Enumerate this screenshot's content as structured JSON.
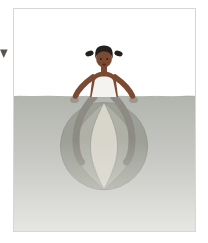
{
  "page": {
    "background": "#ffffff"
  },
  "marker": {
    "name": "down-triangle-marker",
    "color": "#5b544d"
  },
  "frame": {
    "border_color": "#d6d6d3",
    "background": "#ffffff"
  },
  "scene": {
    "label": "girl-sitting-on-beach-ball-in-water",
    "colors": {
      "water_top": "#b2b4ae",
      "water_mid": "#c7c8c3",
      "water_bottom": "#e6e6e3",
      "waterline_edge": "#a7a9a2",
      "ball_dark": "#9da095",
      "ball_mid": "#afb1a7",
      "ball_stripe": "#d8d6cb",
      "ball_outline": "#90938a",
      "leg": "#8d8b83",
      "underwater_skin": "#9a968d",
      "skin": "#7c4a33",
      "skin_dark": "#54291b",
      "hair": "#25201c",
      "swimsuit": "#f4f3ef"
    }
  }
}
